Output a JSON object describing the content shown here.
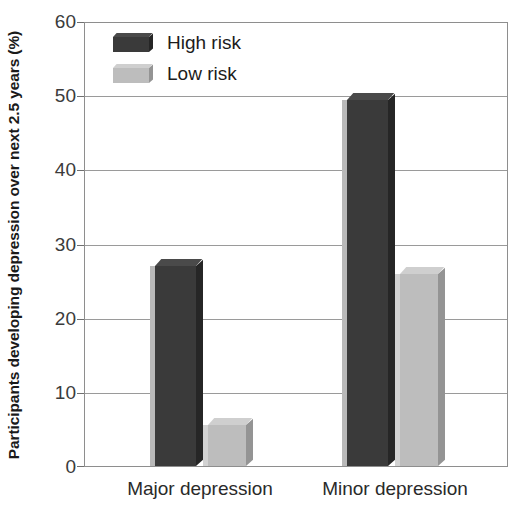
{
  "chart_data": {
    "type": "bar",
    "title": "",
    "xlabel": "",
    "ylabel": "Participants developing depression over next 2.5 years (%)",
    "categories": [
      "Major depression",
      "Minor depression"
    ],
    "series": [
      {
        "name": "High risk",
        "values": [
          27,
          49.5
        ],
        "color": "#3a3a3a"
      },
      {
        "name": "Low risk",
        "values": [
          5.5,
          26
        ],
        "color": "#bdbdbd"
      }
    ],
    "ylim": [
      0,
      60
    ],
    "yticks": [
      0,
      10,
      20,
      30,
      40,
      50,
      60
    ],
    "ytick_labels": [
      "0",
      "10",
      "20",
      "30",
      "40",
      "50",
      "60"
    ],
    "grid": true,
    "legend_position": "top-left",
    "style": "3d-bars"
  },
  "axis": {
    "y_title": "Participants developing depression over next 2.5 years (%)",
    "y_tick_labels": [
      "60",
      "50",
      "40",
      "30",
      "20",
      "10",
      "0"
    ]
  },
  "legend": {
    "entries": [
      {
        "label": "High risk",
        "swatch": "dark-swatch"
      },
      {
        "label": "Low risk",
        "swatch": "light-swatch"
      }
    ]
  },
  "categories": [
    {
      "label": "Major depression"
    },
    {
      "label": "Minor depression"
    }
  ]
}
